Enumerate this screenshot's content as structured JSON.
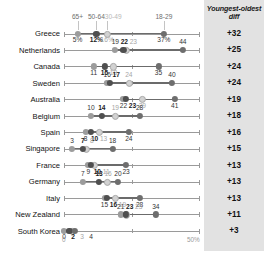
{
  "chart_data": {
    "type": "scatter",
    "title": "",
    "subtitle": "",
    "xlabel": "",
    "ylabel": "",
    "xlim": [
      0,
      50
    ],
    "grid": false,
    "legend_position": "top",
    "axis_ticks": [
      "0",
      "50%"
    ],
    "legend": [
      {
        "name": "65+",
        "color": "#9c9c9c"
      },
      {
        "name": "50-64",
        "color": "#4f4f4f"
      },
      {
        "name": "30-49",
        "color": "#d2d2d2"
      },
      {
        "name": "18-29",
        "color": "#6e6e6e"
      }
    ],
    "diff_header": "Youngest-oldest diff",
    "categories": [
      "Greece",
      "Netherlands",
      "Canada",
      "Sweden",
      "Australia",
      "Belgium",
      "Spain",
      "Singapore",
      "France",
      "Germany",
      "Italy",
      "New Zealand",
      "South Korea"
    ],
    "series": [
      {
        "name": "65+",
        "values": [
          5,
          19,
          11,
          16,
          22,
          10,
          8,
          3,
          9,
          7,
          15,
          21,
          0
        ]
      },
      {
        "name": "50-64",
        "values": [
          12,
          22,
          15,
          17,
          23,
          14,
          10,
          7,
          10,
          13,
          16,
          23,
          2
        ]
      },
      {
        "name": "30-49",
        "values": [
          16,
          23,
          18,
          24,
          29,
          19,
          13,
          8,
          11,
          16,
          19,
          23,
          3
        ]
      },
      {
        "name": "18-29",
        "values": [
          37,
          44,
          35,
          40,
          41,
          28,
          24,
          18,
          23,
          20,
          28,
          34,
          4
        ]
      }
    ],
    "diffs": [
      "+32",
      "+25",
      "+24",
      "+24",
      "+19",
      "+18",
      "+16",
      "+15",
      "+13",
      "+13",
      "+13",
      "+11",
      "+3"
    ],
    "point_labels": [
      [
        "5%",
        "12%",
        "16%",
        "37%"
      ],
      [
        "19",
        "22",
        "23",
        "44"
      ],
      [
        "11",
        "15",
        "18",
        "35"
      ],
      [
        "16",
        "17",
        "24",
        "40"
      ],
      [
        "22",
        "23",
        "29",
        "41"
      ],
      [
        "10",
        "14",
        "19",
        "28"
      ],
      [
        "8",
        "10",
        "13",
        "24"
      ],
      [
        "3",
        "7",
        "8",
        "18"
      ],
      [
        "9",
        "10",
        "11",
        "23"
      ],
      [
        "7",
        "13",
        "16",
        "20"
      ],
      [
        "15",
        "16",
        "19",
        "28"
      ],
      [
        "21",
        "23",
        "23",
        "34"
      ],
      [
        "0",
        "2",
        "3",
        "4"
      ]
    ]
  }
}
